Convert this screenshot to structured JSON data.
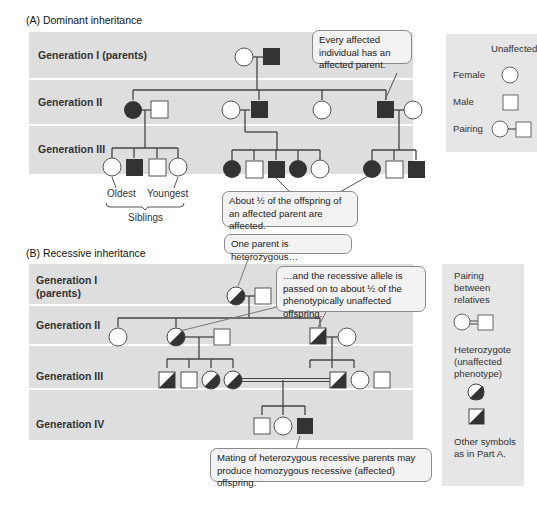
{
  "part_a": {
    "title": "(A) Dominant inheritance",
    "generations": [
      "Generation I (parents)",
      "Generation II",
      "Generation III"
    ],
    "callout_top": "Every affected individual has an affected parent.",
    "callout_bottom": "About ½ of the offspring of an affected parent are affected.",
    "siblings": {
      "oldest": "Oldest",
      "youngest": "Youngest",
      "label": "Siblings"
    },
    "legend": {
      "header": "Unaffected",
      "female": "Female",
      "male": "Male",
      "pairing": "Pairing"
    }
  },
  "part_b": {
    "title": "(B) Recessive inheritance",
    "generations": [
      "Generation I\n(parents)",
      "Generation II",
      "Generation III",
      "Generation IV"
    ],
    "callout_heterozygous": "One parent is heterozygous…",
    "callout_passed": "…and the recessive allele is passed on to about ½ of the phenotypically unaffected offspring.",
    "callout_mating": "Mating of heterozygous recessive parents may produce homozygous recessive (affected) offspring.",
    "legend": {
      "pairing_relatives": "Pairing between relatives",
      "heterozygote": "Heterozygote (unaffected phenotype)",
      "other": "Other symbols as in Part A."
    }
  },
  "colors": {
    "band": "#dedede",
    "affected": "#333333",
    "line": "#444444",
    "callout_bg": "#f3f3f3"
  }
}
